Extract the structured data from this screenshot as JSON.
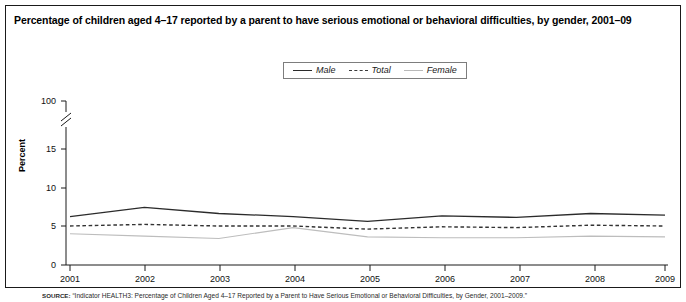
{
  "title": "Percentage of children aged 4–17 reported by a parent to have serious emotional or behavioral difficulties, by gender, 2001–09",
  "legend": {
    "entries": [
      {
        "label": "Male",
        "style": "solid-dark",
        "color": "#2b2b2b"
      },
      {
        "label": "Total",
        "style": "dashed",
        "color": "#3a3a3a"
      },
      {
        "label": "Female",
        "style": "solid-light",
        "color": "#b9b9b9"
      }
    ]
  },
  "axes": {
    "y_title": "Percent",
    "y_ticks": [
      "0",
      "5",
      "10",
      "15",
      "100"
    ],
    "y_break": true,
    "x_ticks": [
      "2001",
      "2002",
      "2003",
      "2004",
      "2005",
      "2006",
      "2007",
      "2008",
      "2009"
    ]
  },
  "source": {
    "lead": "SOURCE:",
    "text": "“Indicator HEALTH3: Percentage of Children Aged 4–17 Reported by a Parent to Have Serious Emotional or Behavioral Difficulties, by Gender, 2001–2009.”"
  },
  "chart_data": {
    "type": "line",
    "title": "Percentage of children aged 4–17 reported by a parent to have serious emotional or behavioral difficulties, by gender, 2001–09",
    "xlabel": "",
    "ylabel": "Percent",
    "x": [
      2001,
      2002,
      2003,
      2004,
      2005,
      2006,
      2007,
      2008,
      2009
    ],
    "ylim": [
      0,
      15
    ],
    "yticks": [
      0,
      5,
      10,
      15,
      100
    ],
    "axis_break": {
      "between": [
        15,
        100
      ]
    },
    "grid": false,
    "legend_position": "top-center",
    "series": [
      {
        "name": "Male",
        "values": [
          6.2,
          7.4,
          6.6,
          6.2,
          5.6,
          6.3,
          6.1,
          6.6,
          6.4
        ]
      },
      {
        "name": "Total",
        "values": [
          5.0,
          5.2,
          5.0,
          5.0,
          4.6,
          4.9,
          4.8,
          5.1,
          5.0
        ]
      },
      {
        "name": "Female",
        "values": [
          4.0,
          3.7,
          3.4,
          4.8,
          3.6,
          3.5,
          3.5,
          3.7,
          3.6
        ]
      }
    ]
  }
}
